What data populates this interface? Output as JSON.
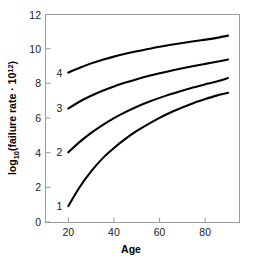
{
  "chart_data": {
    "type": "line",
    "title": "",
    "subtitle": "",
    "xlabel": "Age",
    "ylabel": "log10(failure rate · 10^12)",
    "ylabel_parts": {
      "base": "log",
      "sub": "10",
      "mid": "(failure rate · 10",
      "sup": "12",
      "tail": ")"
    },
    "xlim": [
      10,
      95
    ],
    "ylim": [
      0,
      12
    ],
    "xticks": [
      20,
      40,
      60,
      80
    ],
    "yticks": [
      0,
      2,
      4,
      6,
      8,
      10,
      12
    ],
    "xtick_labels": [
      "20",
      "40",
      "60",
      "80"
    ],
    "ytick_labels": [
      "0",
      "2",
      "4",
      "6",
      "8",
      "10",
      "12"
    ],
    "grid": false,
    "legend_position": "inline-left-labels",
    "x": [
      20,
      25,
      30,
      35,
      40,
      45,
      50,
      55,
      60,
      65,
      70,
      75,
      80,
      85,
      90
    ],
    "series": [
      {
        "name": "1",
        "label": "1",
        "color": "#000000",
        "values": [
          0.95,
          2.05,
          2.95,
          3.7,
          4.3,
          4.82,
          5.28,
          5.68,
          6.04,
          6.36,
          6.64,
          6.9,
          7.12,
          7.32,
          7.48
        ]
      },
      {
        "name": "2",
        "label": "2",
        "color": "#000000",
        "values": [
          4.05,
          4.65,
          5.17,
          5.62,
          6.02,
          6.37,
          6.68,
          6.95,
          7.19,
          7.41,
          7.61,
          7.8,
          7.97,
          8.13,
          8.33
        ]
      },
      {
        "name": "3",
        "label": "3",
        "color": "#000000",
        "values": [
          6.58,
          6.98,
          7.31,
          7.6,
          7.85,
          8.07,
          8.27,
          8.45,
          8.61,
          8.76,
          8.9,
          9.03,
          9.15,
          9.27,
          9.4
        ]
      },
      {
        "name": "4",
        "label": "4",
        "color": "#000000",
        "values": [
          8.65,
          8.93,
          9.18,
          9.39,
          9.57,
          9.73,
          9.88,
          10.01,
          10.14,
          10.25,
          10.36,
          10.46,
          10.55,
          10.65,
          10.78
        ]
      }
    ],
    "annotations": [
      {
        "text": "1",
        "x": 20,
        "y": 0.95,
        "placement": "left-of-curve-start"
      },
      {
        "text": "2",
        "x": 20,
        "y": 4.05,
        "placement": "left-of-curve-start"
      },
      {
        "text": "3",
        "x": 20,
        "y": 6.58,
        "placement": "left-of-curve-start"
      },
      {
        "text": "4",
        "x": 20,
        "y": 8.65,
        "placement": "left-of-curve-start"
      }
    ],
    "style": {
      "frame_color": "#9a9a9a",
      "curve_color": "#000000",
      "text_color": "#1a1a1a",
      "background": "#ffffff"
    }
  }
}
